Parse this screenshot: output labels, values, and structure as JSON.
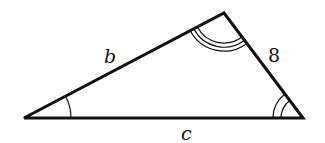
{
  "diagram": {
    "type": "triangle",
    "vertices": {
      "left": [
        24,
        118
      ],
      "top": [
        224,
        13
      ],
      "right": [
        303,
        118
      ]
    },
    "sides": {
      "b": {
        "label": "b",
        "between": [
          "left",
          "top"
        ]
      },
      "a": {
        "label": "8",
        "between": [
          "top",
          "right"
        ]
      },
      "c": {
        "label": "c",
        "between": [
          "left",
          "right"
        ]
      }
    },
    "angle_marks": {
      "left": {
        "arcs": 1
      },
      "right": {
        "arcs": 2
      },
      "top": {
        "arcs": 3
      }
    },
    "colors": {
      "stroke": "#111111",
      "background": "#ffffff"
    }
  }
}
